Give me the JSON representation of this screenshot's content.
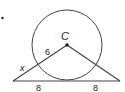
{
  "diagram": {
    "type": "geometry",
    "colors": {
      "stroke": "#333333",
      "text": "#222222",
      "background": "#ffffff"
    },
    "circle": {
      "center_label": "C",
      "cx": 67,
      "cy": 45,
      "r": 35
    },
    "points": {
      "C": [
        67,
        45
      ],
      "left": [
        13,
        81
      ],
      "right": [
        120,
        81
      ]
    },
    "labels": {
      "center": "C",
      "radius": "6",
      "unknown": "x",
      "base_left": "8",
      "base_right": "8"
    },
    "bullet": "•"
  }
}
